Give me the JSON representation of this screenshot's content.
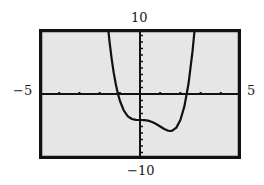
{
  "window": {
    "xmin_label": "−5",
    "xmax_label": "5",
    "ymin_label": "−10",
    "ymax_label": "10"
  },
  "colors": {
    "screen_bg": "#e6e6e6",
    "frame": "#111111",
    "axis": "#111111",
    "curve": "#111111",
    "page_bg": "#ffffff"
  },
  "chart_data": {
    "type": "line",
    "title": "",
    "xlabel": "",
    "ylabel": "",
    "xlim": [
      -5,
      5
    ],
    "ylim": [
      -10,
      10
    ],
    "xscale_tick": 1,
    "yscale_tick": 1,
    "grid": false,
    "legend": null,
    "tick_labels": {
      "x": [
        "−5",
        "5"
      ],
      "y": [
        "−10",
        "10"
      ]
    },
    "series": [
      {
        "name": "f(x)",
        "x": [
          -1.6,
          -1.5,
          -1.4,
          -1.3,
          -1.2,
          -1.1,
          -1.0,
          -0.8,
          -0.6,
          -0.4,
          -0.2,
          0.0,
          0.2,
          0.4,
          0.6,
          0.8,
          1.0,
          1.2,
          1.4,
          1.5,
          1.6,
          1.8,
          2.0,
          2.2,
          2.4,
          2.6,
          2.7,
          2.72
        ],
        "y": [
          10.75,
          7.81,
          5.33,
          3.25,
          1.53,
          0.13,
          -1.0,
          -2.57,
          -3.44,
          -3.85,
          -3.98,
          -4.0,
          -4.01,
          -4.1,
          -4.3,
          -4.61,
          -5.0,
          -5.38,
          -5.65,
          -5.69,
          -5.64,
          -5.17,
          -4.0,
          -1.87,
          1.53,
          6.55,
          9.77,
          10.49
        ]
      }
    ],
    "annotations": []
  }
}
